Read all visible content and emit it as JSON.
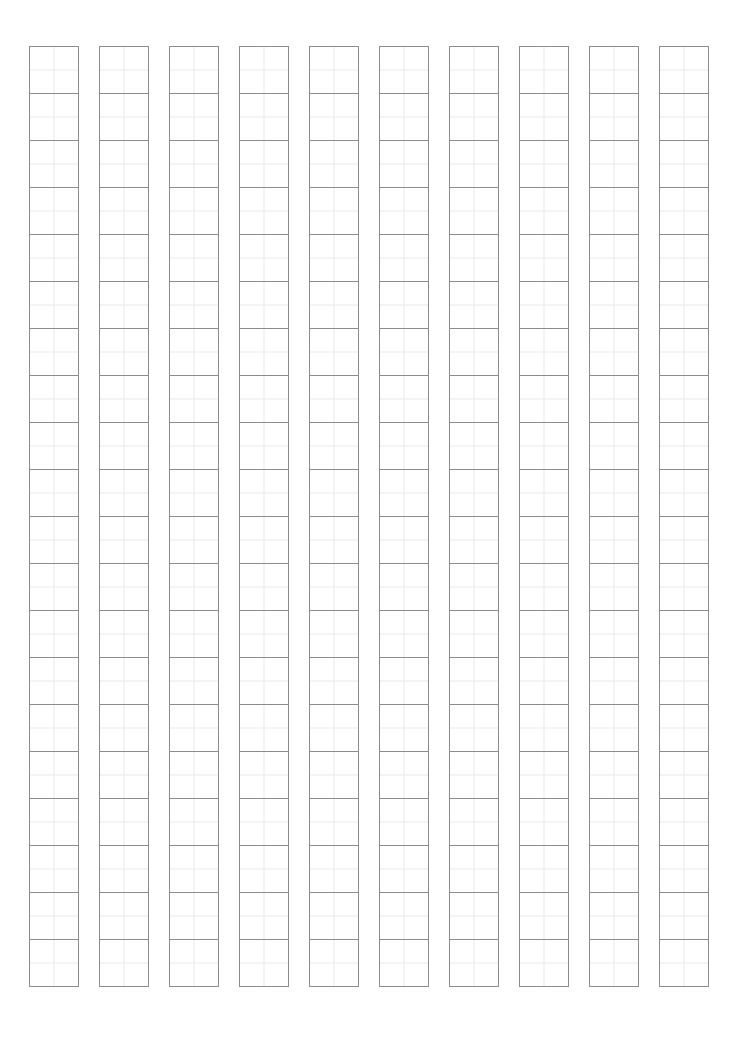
{
  "page": {
    "kind": "manuscript-grid-sheet",
    "width": 739,
    "height": 1056,
    "background_color": "#ffffff",
    "orientation": "portrait"
  },
  "grid": {
    "columns": 10,
    "cells_per_column": 20,
    "total_cells": 200,
    "cell_width": 50,
    "cell_height": 48,
    "column_width": 50,
    "column_gap": 20,
    "column_pitch": 70,
    "origin_x": 29,
    "origin_y": 46,
    "grid_width": 680,
    "grid_height": 961,
    "cell_border_color": "#8c8c8c",
    "cell_border_width": 1,
    "guide_line_color": "#e9e9e9",
    "guide_line_width": 1,
    "guides_per_cell": 2,
    "cell_fill_color": "#ffffff",
    "margins": {
      "left": 29,
      "top": 46,
      "right": 34,
      "bottom": 48
    },
    "column_order": "left-to-right",
    "cell_contents": [
      [
        "",
        "",
        "",
        "",
        "",
        "",
        "",
        "",
        "",
        "",
        "",
        "",
        "",
        "",
        "",
        "",
        "",
        "",
        "",
        ""
      ],
      [
        "",
        "",
        "",
        "",
        "",
        "",
        "",
        "",
        "",
        "",
        "",
        "",
        "",
        "",
        "",
        "",
        "",
        "",
        "",
        ""
      ],
      [
        "",
        "",
        "",
        "",
        "",
        "",
        "",
        "",
        "",
        "",
        "",
        "",
        "",
        "",
        "",
        "",
        "",
        "",
        "",
        ""
      ],
      [
        "",
        "",
        "",
        "",
        "",
        "",
        "",
        "",
        "",
        "",
        "",
        "",
        "",
        "",
        "",
        "",
        "",
        "",
        "",
        ""
      ],
      [
        "",
        "",
        "",
        "",
        "",
        "",
        "",
        "",
        "",
        "",
        "",
        "",
        "",
        "",
        "",
        "",
        "",
        "",
        "",
        ""
      ],
      [
        "",
        "",
        "",
        "",
        "",
        "",
        "",
        "",
        "",
        "",
        "",
        "",
        "",
        "",
        "",
        "",
        "",
        "",
        "",
        ""
      ],
      [
        "",
        "",
        "",
        "",
        "",
        "",
        "",
        "",
        "",
        "",
        "",
        "",
        "",
        "",
        "",
        "",
        "",
        "",
        "",
        ""
      ],
      [
        "",
        "",
        "",
        "",
        "",
        "",
        "",
        "",
        "",
        "",
        "",
        "",
        "",
        "",
        "",
        "",
        "",
        "",
        "",
        ""
      ],
      [
        "",
        "",
        "",
        "",
        "",
        "",
        "",
        "",
        "",
        "",
        "",
        "",
        "",
        "",
        "",
        "",
        "",
        "",
        "",
        ""
      ],
      [
        "",
        "",
        "",
        "",
        "",
        "",
        "",
        "",
        "",
        "",
        "",
        "",
        "",
        "",
        "",
        "",
        "",
        "",
        "",
        ""
      ]
    ]
  }
}
